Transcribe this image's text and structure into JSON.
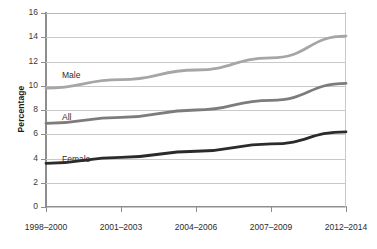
{
  "chart_data": {
    "type": "line",
    "title": "",
    "xlabel": "",
    "ylabel": "Percentage",
    "categories": [
      "1998–2000",
      "2001–2003",
      "2004–2006",
      "2007–2009",
      "2012–2014"
    ],
    "ylim": [
      0,
      16
    ],
    "ytick_values": [
      0,
      2,
      4,
      6,
      8,
      10,
      12,
      14,
      16
    ],
    "ytick_labels": [
      "0",
      "2",
      "4",
      "6",
      "8",
      "10",
      "12",
      "14",
      "16"
    ],
    "grid": true,
    "legend": "inline-labels",
    "series": [
      {
        "name": "Male",
        "values": [
          9.8,
          10.5,
          11.3,
          12.3,
          14.1
        ],
        "color": "#a6a6a6",
        "label": "Male"
      },
      {
        "name": "All",
        "values": [
          6.9,
          7.4,
          8.0,
          8.8,
          10.2
        ],
        "color": "#7c7c7c",
        "label": "All"
      },
      {
        "name": "Female",
        "values": [
          3.6,
          4.1,
          4.6,
          5.2,
          6.2
        ],
        "color": "#2b2b2b",
        "label": "Female"
      }
    ],
    "annotations": [
      {
        "text": "Male",
        "series": "Male"
      },
      {
        "text": "All",
        "series": "All"
      },
      {
        "text": "Female",
        "series": "Female"
      }
    ],
    "colors": {
      "male": "#a6a6a6",
      "all": "#7c7c7c",
      "female": "#2b2b2b",
      "grid": "#c9c9c9",
      "axis": "#8e8e8e",
      "text": "#2c2c2c",
      "background": "#ffffff"
    }
  }
}
